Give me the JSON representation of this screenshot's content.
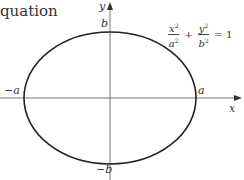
{
  "caption": "quation",
  "diagram": {
    "type": "ellipse",
    "axes": {
      "x_label": "x",
      "y_label": "y"
    },
    "points": {
      "left": "−a",
      "right": "a",
      "top": "b",
      "bottom": "−b"
    },
    "equation": {
      "term1_num": "x",
      "term1_den": "a",
      "term2_num": "y",
      "term2_den": "b",
      "exponent": "2",
      "plus": "+",
      "equals": "= 1"
    },
    "colors": {
      "curve": "#222222",
      "axis": "#444444"
    }
  }
}
